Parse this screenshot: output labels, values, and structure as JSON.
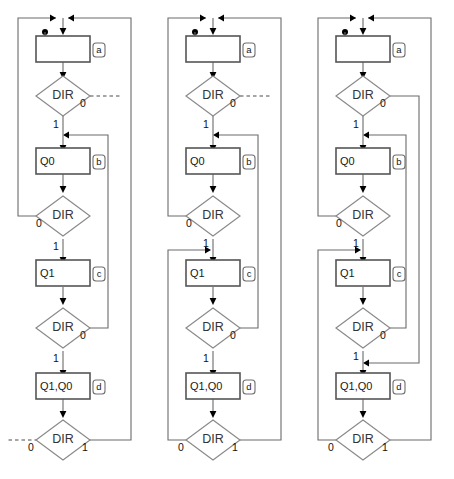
{
  "diagram": {
    "title": "",
    "type": "flowchart",
    "colors": {
      "background": "#ffffff",
      "edge": "#6b6b6b",
      "box_stroke": "#555555",
      "decision_stroke": "#8a8a8a",
      "text": "#1a1a1a",
      "marker": "#000000"
    },
    "decision_label": "DIR",
    "branch_labels": {
      "zero": "0",
      "one": "1"
    },
    "columns": [
      {
        "name": "column-1",
        "index": 1,
        "nodes": [
          {
            "id": "a",
            "badge": "a",
            "text": "",
            "kind": "process"
          },
          {
            "id": "dir1",
            "badge": "",
            "text": "DIR",
            "kind": "decision",
            "left_label": "",
            "right_label": "0",
            "down_label": "1"
          },
          {
            "id": "b",
            "badge": "b",
            "text": "Q0",
            "kind": "process"
          },
          {
            "id": "dir2",
            "badge": "",
            "text": "DIR",
            "kind": "decision",
            "left_label": "0",
            "right_label": "",
            "down_label": "1"
          },
          {
            "id": "c",
            "badge": "c",
            "text": "Q1",
            "kind": "process"
          },
          {
            "id": "dir3",
            "badge": "",
            "text": "DIR",
            "kind": "decision",
            "left_label": "",
            "right_label": "0",
            "down_label": "1"
          },
          {
            "id": "d",
            "badge": "d",
            "text": "Q1,Q0",
            "kind": "process"
          },
          {
            "id": "dir4",
            "badge": "",
            "text": "DIR",
            "kind": "decision",
            "left_label": "0",
            "right_label": "1",
            "down_label": ""
          }
        ]
      },
      {
        "name": "column-2",
        "index": 2,
        "nodes": [
          {
            "id": "a",
            "badge": "a",
            "text": "",
            "kind": "process"
          },
          {
            "id": "dir1",
            "badge": "",
            "text": "DIR",
            "kind": "decision",
            "left_label": "",
            "right_label": "0",
            "down_label": "1"
          },
          {
            "id": "b",
            "badge": "b",
            "text": "Q0",
            "kind": "process"
          },
          {
            "id": "dir2",
            "badge": "",
            "text": "DIR",
            "kind": "decision",
            "left_label": "0",
            "right_label": "",
            "down_label": "1"
          },
          {
            "id": "c",
            "badge": "c",
            "text": "Q1",
            "kind": "process"
          },
          {
            "id": "dir3",
            "badge": "",
            "text": "DIR",
            "kind": "decision",
            "left_label": "",
            "right_label": "0",
            "down_label": "1"
          },
          {
            "id": "d",
            "badge": "d",
            "text": "Q1,Q0",
            "kind": "process"
          },
          {
            "id": "dir4",
            "badge": "",
            "text": "DIR",
            "kind": "decision",
            "left_label": "0",
            "right_label": "1",
            "down_label": ""
          }
        ]
      },
      {
        "name": "column-3",
        "index": 3,
        "nodes": [
          {
            "id": "a",
            "badge": "a",
            "text": "",
            "kind": "process"
          },
          {
            "id": "dir1",
            "badge": "",
            "text": "DIR",
            "kind": "decision",
            "left_label": "",
            "right_label": "0",
            "down_label": "1"
          },
          {
            "id": "b",
            "badge": "b",
            "text": "Q0",
            "kind": "process"
          },
          {
            "id": "dir2",
            "badge": "",
            "text": "DIR",
            "kind": "decision",
            "left_label": "0",
            "right_label": "",
            "down_label": "1"
          },
          {
            "id": "c",
            "badge": "c",
            "text": "Q1",
            "kind": "process"
          },
          {
            "id": "dir3",
            "badge": "",
            "text": "DIR",
            "kind": "decision",
            "left_label": "",
            "right_label": "0",
            "down_label": "1"
          },
          {
            "id": "d",
            "badge": "d",
            "text": "Q1,Q0",
            "kind": "process"
          },
          {
            "id": "dir4",
            "badge": "",
            "text": "DIR",
            "kind": "decision",
            "left_label": "0",
            "right_label": "1",
            "down_label": ""
          }
        ]
      }
    ]
  }
}
